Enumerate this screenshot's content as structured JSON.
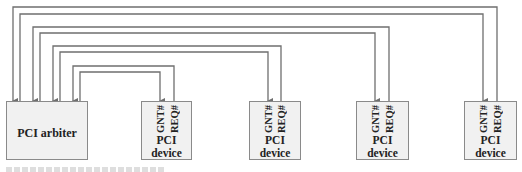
{
  "arbiter": {
    "label": "PCI arbiter"
  },
  "devices": [
    {
      "gnt_label": "GNT#",
      "req_label": "REQ#",
      "label_line1": "PCI",
      "label_line2": "device"
    },
    {
      "gnt_label": "GNT#",
      "req_label": "REQ#",
      "label_line1": "PCI",
      "label_line2": "device"
    },
    {
      "gnt_label": "GNT#",
      "req_label": "REQ#",
      "label_line1": "PCI",
      "label_line2": "device"
    },
    {
      "gnt_label": "GNT#",
      "req_label": "REQ#",
      "label_line1": "PCI",
      "label_line2": "device"
    }
  ],
  "colors": {
    "wire": "#6f6f6f",
    "box_fill": "#f1f1f1",
    "box_border": "#8a8a8a",
    "text": "#222222"
  }
}
